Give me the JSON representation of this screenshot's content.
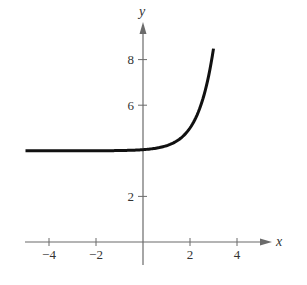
{
  "chart_data": {
    "type": "line",
    "title": "",
    "xlabel": "x",
    "ylabel": "y",
    "xlim": [
      -5,
      5.5
    ],
    "ylim": [
      -1,
      9.5
    ],
    "x_ticks": [
      -4,
      -2,
      2,
      4
    ],
    "y_ticks": [
      2,
      6,
      8
    ],
    "x_tick_labels": [
      "−4",
      "−2",
      "2",
      "4"
    ],
    "y_tick_labels": [
      "2",
      "6",
      "8"
    ],
    "grid": false,
    "legend": null,
    "series": [
      {
        "name": "f(x)",
        "approx_formula": "y = 4 + e^(1.5(x-2)) (estimated)",
        "x": [
          -5,
          -4,
          -3,
          -2,
          -1,
          0,
          0.5,
          1,
          1.5,
          2,
          2.25,
          2.5,
          2.75,
          3
        ],
        "y": [
          4.0,
          4.0,
          4.0,
          4.0,
          4.0,
          4.05,
          4.1,
          4.22,
          4.47,
          5.0,
          5.45,
          6.1,
          7.08,
          8.5
        ],
        "color": "#111111"
      }
    ],
    "asymptote": {
      "type": "horizontal",
      "y": 4
    }
  }
}
